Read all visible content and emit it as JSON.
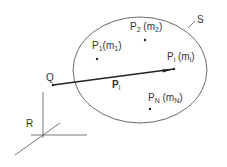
{
  "diagram": {
    "region_label": "S",
    "origin_label": "R",
    "point_q_label": "Q",
    "vector_label": {
      "main": "P",
      "sub": "i"
    },
    "points": [
      {
        "id": "p1",
        "name": "P",
        "sub": "1",
        "mass": "m",
        "mass_sub": "1"
      },
      {
        "id": "p2",
        "name": "P",
        "sub": "2",
        "mass": "m",
        "mass_sub": "2"
      },
      {
        "id": "pi",
        "name": "P",
        "sub": "i",
        "mass": "m",
        "mass_sub": "i"
      },
      {
        "id": "pn",
        "name": "P",
        "sub": "N",
        "mass": "m",
        "mass_sub": "N"
      }
    ],
    "colors": {
      "line": "#333333",
      "background": "#ffffff"
    }
  }
}
